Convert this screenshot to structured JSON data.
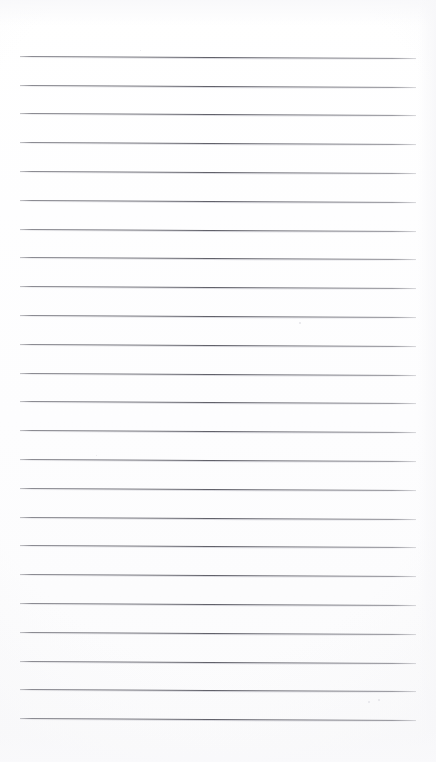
{
  "page": {
    "kind": "lined-notebook-page",
    "width": 436,
    "height": 762,
    "background_color": "#ffffff",
    "content_text": "",
    "has_text": false,
    "has_header": false,
    "has_page_number": false
  },
  "ruling": {
    "line_color": "#60606 9",
    "line_color_hex": "#606069",
    "line_count": 24,
    "first_line_y": 55.7,
    "line_spacing": 28.8,
    "line_left_x": 20,
    "line_right_x": 416,
    "line_thickness": 1,
    "slope_px": 2,
    "margin_rule": false,
    "margin_rule_color": "",
    "top_blank_margin": 55,
    "bottom_blank_margin": 44
  },
  "lines": [
    {
      "index": 1,
      "y": 55.7,
      "text": ""
    },
    {
      "index": 2,
      "y": 84.5,
      "text": ""
    },
    {
      "index": 3,
      "y": 113.3,
      "text": ""
    },
    {
      "index": 4,
      "y": 142.1,
      "text": ""
    },
    {
      "index": 5,
      "y": 170.9,
      "text": ""
    },
    {
      "index": 6,
      "y": 199.7,
      "text": ""
    },
    {
      "index": 7,
      "y": 228.5,
      "text": ""
    },
    {
      "index": 8,
      "y": 257.3,
      "text": ""
    },
    {
      "index": 9,
      "y": 286.1,
      "text": ""
    },
    {
      "index": 10,
      "y": 314.9,
      "text": ""
    },
    {
      "index": 11,
      "y": 343.7,
      "text": ""
    },
    {
      "index": 12,
      "y": 372.5,
      "text": ""
    },
    {
      "index": 13,
      "y": 401.3,
      "text": ""
    },
    {
      "index": 14,
      "y": 430.1,
      "text": ""
    },
    {
      "index": 15,
      "y": 458.9,
      "text": ""
    },
    {
      "index": 16,
      "y": 487.7,
      "text": ""
    },
    {
      "index": 17,
      "y": 516.5,
      "text": ""
    },
    {
      "index": 18,
      "y": 545.3,
      "text": ""
    },
    {
      "index": 19,
      "y": 574.1,
      "text": ""
    },
    {
      "index": 20,
      "y": 602.9,
      "text": ""
    },
    {
      "index": 21,
      "y": 631.7,
      "text": ""
    },
    {
      "index": 22,
      "y": 660.5,
      "text": ""
    },
    {
      "index": 23,
      "y": 689.3,
      "text": ""
    },
    {
      "index": 24,
      "y": 718.1,
      "text": ""
    }
  ],
  "specks": [
    {
      "x": 368,
      "y": 701,
      "size": 2.2
    },
    {
      "x": 378,
      "y": 699,
      "size": 1.6
    },
    {
      "x": 140,
      "y": 50,
      "size": 1.4
    },
    {
      "x": 299,
      "y": 322,
      "size": 1.5
    },
    {
      "x": 96,
      "y": 455,
      "size": 1.3
    }
  ]
}
